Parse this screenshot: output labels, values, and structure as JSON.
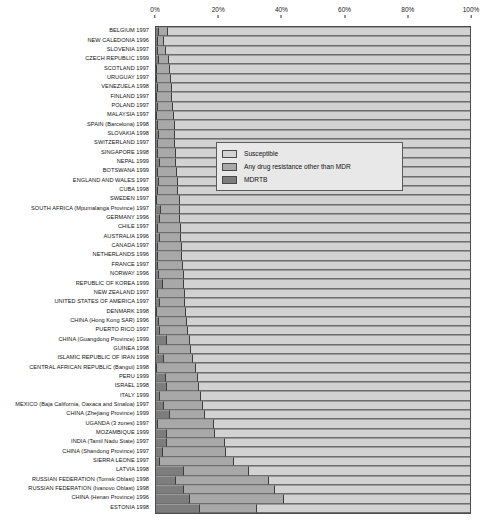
{
  "chart_data": {
    "type": "bar",
    "subtype": "horizontal-stacked-100",
    "title": "",
    "xlabel": "",
    "ylabel": "",
    "xlim": [
      0,
      100
    ],
    "xticks": [
      "0%",
      "20%",
      "40%",
      "60%",
      "80%",
      "100%"
    ],
    "xtick_values": [
      0,
      20,
      40,
      60,
      80,
      100
    ],
    "grid": false,
    "legend_position": "upper-right-inside",
    "legend": [
      {
        "key": "susceptible",
        "label": "Susceptible",
        "color": "#d2d2d2"
      },
      {
        "key": "other",
        "label": "Any drug resistance other than MDR",
        "color": "#a8a8a8"
      },
      {
        "key": "mdr",
        "label": "MDRTB",
        "color": "#7d7d7d"
      }
    ],
    "series": [
      {
        "name": "MDRTB",
        "key": "mdr",
        "color": "#7d7d7d"
      },
      {
        "name": "Any drug resistance other than MDR",
        "key": "other",
        "color": "#a8a8a8"
      },
      {
        "name": "Susceptible",
        "key": "susceptible",
        "color": "#d2d2d2"
      }
    ],
    "categories": [
      "BELGIUM 1997",
      "NEW CALEDONIA 1996",
      "SLOVENIA 1997",
      "CZECH REPUBLIC 1999",
      "SCOTLAND 1997",
      "URUGUAY 1997",
      "VENEZUELA 1998",
      "FINLAND 1997",
      "POLAND 1997",
      "MALAYSIA 1997",
      "SPAIN (Barcelona) 1998",
      "SLOVAKIA 1998",
      "SWITZERLAND 1997",
      "SINGAPORE 1998",
      "NEPAL 1999",
      "BOTSWANA 1999",
      "ENGLAND AND WALES 1997",
      "CUBA 1998",
      "SWEDEN 1997",
      "SOUTH AFRICA (Mpumalanga Province) 1997",
      "GERMANY 1996",
      "CHILE 1997",
      "AUSTRALIA 1996",
      "CANADA 1997",
      "NETHERLANDS 1996",
      "FRANCE 1997",
      "NORWAY 1996",
      "REPUBLIC OF KOREA 1999",
      "NEW ZEALAND 1997",
      "UNITED STATES OF AMERICA 1997",
      "DENMARK 1998",
      "CHINA (Hong Kong SAR) 1996",
      "PUERTO RICO 1997",
      "CHINA (Guangdong Province) 1999",
      "GUINEA 1998",
      "ISLAMIC REPUBLIC OF IRAN 1998",
      "CENTRAL AFRICAN REPUBLIC (Bangui) 1998",
      "PERU 1999",
      "ISRAEL 1998",
      "ITALY 1999",
      "MEXICO (Baja California, Oaxaca and Sinaloa) 1997",
      "CHINA (Zhejiang Province) 1999",
      "UGANDA (3 zones) 1997",
      "MOZAMBIQUE 1999",
      "INDIA (Tamil Nadu State) 1997",
      "CHINA (Shandong Province) 1997",
      "SIERRA LEONE 1997",
      "LATVIA 1998",
      "RUSSIAN FEDERATION (Tomsk Oblast) 1998",
      "RUSSIAN FEDERATION (Ivanovo Oblast) 1998",
      "CHINA (Henan Province) 1996",
      "ESTONIA 1998"
    ],
    "rows": [
      {
        "label": "BELGIUM 1997",
        "mdr": 0.9,
        "other": 2.8,
        "susceptible": 96.3
      },
      {
        "label": "NEW CALEDONIA 1996",
        "mdr": 0.5,
        "other": 2.2,
        "susceptible": 97.3
      },
      {
        "label": "SLOVENIA 1997",
        "mdr": 0.6,
        "other": 2.6,
        "susceptible": 96.8
      },
      {
        "label": "CZECH REPUBLIC 1999",
        "mdr": 1.1,
        "other": 3.1,
        "susceptible": 95.8
      },
      {
        "label": "SCOTLAND 1997",
        "mdr": 0.3,
        "other": 4.1,
        "susceptible": 95.6
      },
      {
        "label": "URUGUAY 1997",
        "mdr": 0.3,
        "other": 4.6,
        "susceptible": 95.1
      },
      {
        "label": "VENEZUELA 1998",
        "mdr": 0.5,
        "other": 4.6,
        "susceptible": 94.9
      },
      {
        "label": "FINLAND 1997",
        "mdr": 0.3,
        "other": 4.9,
        "susceptible": 94.8
      },
      {
        "label": "POLAND 1997",
        "mdr": 0.6,
        "other": 4.8,
        "susceptible": 94.6
      },
      {
        "label": "MALAYSIA 1997",
        "mdr": 0.3,
        "other": 5.4,
        "susceptible": 94.3
      },
      {
        "label": "SPAIN (Barcelona) 1998",
        "mdr": 0.6,
        "other": 5.3,
        "susceptible": 94.1
      },
      {
        "label": "SLOVAKIA 1998",
        "mdr": 0.8,
        "other": 5.2,
        "susceptible": 94.0
      },
      {
        "label": "SWITZERLAND 1997",
        "mdr": 0.6,
        "other": 5.6,
        "susceptible": 93.8
      },
      {
        "label": "SINGAPORE 1998",
        "mdr": 0.7,
        "other": 5.6,
        "susceptible": 93.7
      },
      {
        "label": "NEPAL 1999",
        "mdr": 1.3,
        "other": 5.2,
        "susceptible": 93.5
      },
      {
        "label": "BOTSWANA 1999",
        "mdr": 0.5,
        "other": 6.2,
        "susceptible": 93.3
      },
      {
        "label": "ENGLAND AND WALES 1997",
        "mdr": 0.8,
        "other": 6.1,
        "susceptible": 93.1
      },
      {
        "label": "CUBA 1998",
        "mdr": 0.7,
        "other": 6.4,
        "susceptible": 92.9
      },
      {
        "label": "SWEDEN 1997",
        "mdr": 0.0,
        "other": 7.3,
        "susceptible": 92.7
      },
      {
        "label": "SOUTH AFRICA (Mpumalanga Province) 1997",
        "mdr": 1.5,
        "other": 6.2,
        "susceptible": 92.3
      },
      {
        "label": "GERMANY 1996",
        "mdr": 1.3,
        "other": 6.5,
        "susceptible": 92.2
      },
      {
        "label": "CHILE 1997",
        "mdr": 0.7,
        "other": 7.2,
        "susceptible": 92.1
      },
      {
        "label": "AUSTRALIA 1996",
        "mdr": 1.3,
        "other": 6.8,
        "susceptible": 91.9
      },
      {
        "label": "CANADA 1997",
        "mdr": 0.6,
        "other": 7.6,
        "susceptible": 91.8
      },
      {
        "label": "NETHERLANDS 1996",
        "mdr": 0.7,
        "other": 7.7,
        "susceptible": 91.6
      },
      {
        "label": "FRANCE 1997",
        "mdr": 0.5,
        "other": 8.1,
        "susceptible": 91.4
      },
      {
        "label": "NORWAY 1996",
        "mdr": 1.1,
        "other": 7.7,
        "susceptible": 91.2
      },
      {
        "label": "REPUBLIC OF KOREA 1999",
        "mdr": 2.2,
        "other": 6.8,
        "susceptible": 91.0
      },
      {
        "label": "NEW ZEALAND 1997",
        "mdr": 0.7,
        "other": 8.4,
        "susceptible": 90.9
      },
      {
        "label": "UNITED STATES OF AMERICA 1997",
        "mdr": 1.2,
        "other": 8.1,
        "susceptible": 90.7
      },
      {
        "label": "DENMARK 1998",
        "mdr": 0.4,
        "other": 9.3,
        "susceptible": 90.3
      },
      {
        "label": "CHINA (Hong Kong SAR) 1996",
        "mdr": 1.0,
        "other": 8.8,
        "susceptible": 90.2
      },
      {
        "label": "PUERTO RICO 1997",
        "mdr": 1.3,
        "other": 9.0,
        "susceptible": 89.7
      },
      {
        "label": "CHINA (Guangdong Province) 1999",
        "mdr": 3.6,
        "other": 7.3,
        "susceptible": 89.1
      },
      {
        "label": "GUINEA 1998",
        "mdr": 1.0,
        "other": 10.3,
        "susceptible": 88.7
      },
      {
        "label": "ISLAMIC REPUBLIC OF IRAN 1998",
        "mdr": 2.4,
        "other": 9.4,
        "susceptible": 88.2
      },
      {
        "label": "CENTRAL AFRICAN REPUBLIC (Bangui) 1998",
        "mdr": 0.4,
        "other": 12.2,
        "susceptible": 87.4
      },
      {
        "label": "PERU 1999",
        "mdr": 3.1,
        "other": 10.2,
        "susceptible": 86.7
      },
      {
        "label": "ISRAEL 1998",
        "mdr": 3.6,
        "other": 10.0,
        "susceptible": 86.4
      },
      {
        "label": "ITALY 1999",
        "mdr": 1.4,
        "other": 12.8,
        "susceptible": 85.8
      },
      {
        "label": "MEXICO (Baja California, Oaxaca and Sinaloa) 1997",
        "mdr": 2.4,
        "other": 12.5,
        "susceptible": 85.1
      },
      {
        "label": "CHINA (Zhejiang Province) 1999",
        "mdr": 4.5,
        "other": 11.0,
        "susceptible": 84.5
      },
      {
        "label": "UGANDA (3 zones) 1997",
        "mdr": 0.5,
        "other": 18.0,
        "susceptible": 81.5
      },
      {
        "label": "MOZAMBIQUE 1999",
        "mdr": 3.4,
        "other": 15.5,
        "susceptible": 81.1
      },
      {
        "label": "INDIA (Tamil Nadu State) 1997",
        "mdr": 3.4,
        "other": 18.5,
        "susceptible": 78.1
      },
      {
        "label": "CHINA (Shandong Province) 1997",
        "mdr": 2.3,
        "other": 20.0,
        "susceptible": 77.7
      },
      {
        "label": "SIERRA LEONE 1997",
        "mdr": 1.4,
        "other": 23.5,
        "susceptible": 75.1
      },
      {
        "label": "LATVIA 1998",
        "mdr": 9.0,
        "other": 20.5,
        "susceptible": 70.5
      },
      {
        "label": "RUSSIAN FEDERATION (Tomsk Oblast) 1998",
        "mdr": 6.5,
        "other": 29.5,
        "susceptible": 64.0
      },
      {
        "label": "RUSSIAN FEDERATION (Ivanovo Oblast) 1998",
        "mdr": 9.0,
        "other": 29.0,
        "susceptible": 62.0
      },
      {
        "label": "CHINA (Henan Province) 1996",
        "mdr": 10.8,
        "other": 30.0,
        "susceptible": 59.2
      },
      {
        "label": "ESTONIA 1998",
        "mdr": 14.1,
        "other": 18.0,
        "susceptible": 67.9
      }
    ]
  }
}
